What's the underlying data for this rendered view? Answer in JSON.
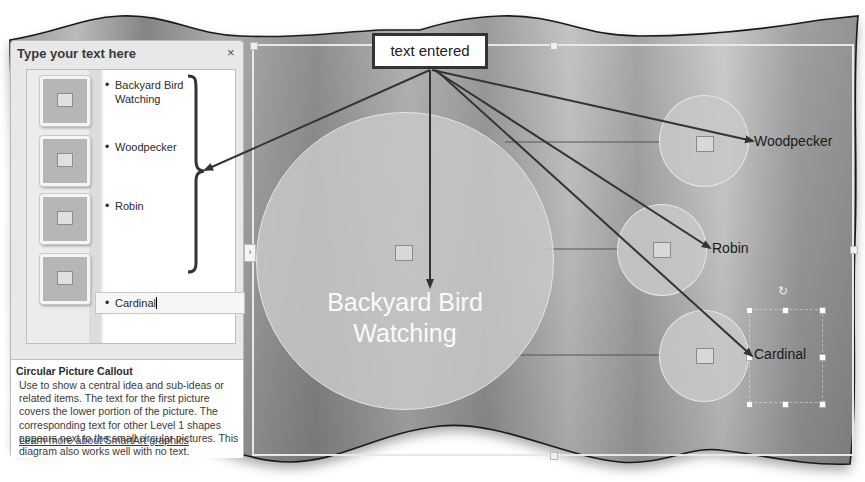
{
  "callout": {
    "label": "text entered"
  },
  "text_pane": {
    "title": "Type your text here",
    "close_label": "×",
    "items": [
      {
        "label": "Backyard Bird Watching"
      },
      {
        "label": "Woodpecker"
      },
      {
        "label": "Robin"
      },
      {
        "label": "Cardinal"
      }
    ],
    "description": {
      "title": "Circular Picture Callout",
      "text": "Use to show a central idea and sub-ideas or related items. The text for the first picture covers the lower portion of the picture. The corresponding text for other Level 1 shapes appears next to the small circular pictures. This diagram also works well with no text.",
      "link": "Learn more about SmartArt graphics"
    }
  },
  "smartart": {
    "layout": "Circular Picture Callout",
    "main_label": "Backyard Bird Watching",
    "shapes": [
      {
        "label": "Woodpecker"
      },
      {
        "label": "Robin"
      },
      {
        "label": "Cardinal"
      }
    ],
    "collapse_tab_glyph": "›",
    "rotate_glyph": "↻"
  },
  "colors": {
    "background_grey": "#8e8e8e",
    "circle_fill": "#c8c8c8",
    "arrow": "#333333",
    "pane_bg": "#e8e8e8"
  }
}
